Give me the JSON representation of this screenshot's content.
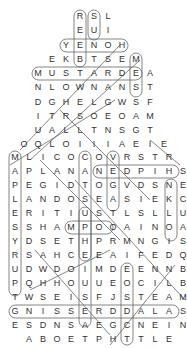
{
  "puzzle": {
    "type": "word-search",
    "shape": "house",
    "rows": [
      {
        "y": 17,
        "x0": 80,
        "letters": "RSL"
      },
      {
        "y": 31,
        "x0": 80,
        "letters": "EUI"
      },
      {
        "y": 46,
        "x0": 66,
        "letters": "YENOH"
      },
      {
        "y": 60,
        "x0": 52,
        "letters": "EKBTSEM"
      },
      {
        "y": 74,
        "x0": 38,
        "letters": "MUSTARDEA"
      },
      {
        "y": 88,
        "x0": 38,
        "letters": "NLOWNANST"
      },
      {
        "y": 103,
        "x0": 38,
        "letters": "DGHELGWSF"
      },
      {
        "y": 117,
        "x0": 38,
        "letters": "ITRSOEOAM"
      },
      {
        "y": 131,
        "x0": 38,
        "letters": "UALLTNSGT"
      },
      {
        "y": 145,
        "x0": 24,
        "letters": "OQLOIIIAEIE"
      },
      {
        "y": 158,
        "x0": 15,
        "letters": "MLICOCOVRSTR"
      },
      {
        "y": 172,
        "x0": 15,
        "letters": "APLANANEDPIHS"
      },
      {
        "y": 186,
        "x0": 15,
        "letters": "PEGIDTOGVDSNE"
      },
      {
        "y": 200,
        "x0": 15,
        "letters": "LANDOSEASIEKC"
      },
      {
        "y": 214,
        "x0": 15,
        "letters": "ERITIUSTLSLLU"
      },
      {
        "y": 228,
        "x0": 15,
        "letters": "SSHAMPOOAINOA"
      },
      {
        "y": 242,
        "x0": 15,
        "letters": "YDSETHPRMNGIS"
      },
      {
        "y": 256,
        "x0": 15,
        "letters": "RSAHCEEAIFEDQ"
      },
      {
        "y": 270,
        "x0": 15,
        "letters": "UDWDOIMDEENNB"
      },
      {
        "y": 284,
        "x0": 15,
        "letters": "PQHHOUUEOCILB"
      },
      {
        "y": 298,
        "x0": 15,
        "letters": "TWSEISFJSTEAM"
      },
      {
        "y": 312,
        "x0": 15,
        "letters": "GNISSERDDALAS"
      },
      {
        "y": 326,
        "x0": 15,
        "letters": "ESDNSAEGCNEIN"
      },
      {
        "y": 340,
        "x0": 29,
        "letters": "ABOETPHTTLE"
      }
    ],
    "col_spacing": 14,
    "found_words_visible": [
      "HONEY",
      "MUSTARD",
      "SHAMPOO",
      "SALAD DRESSING",
      "SHIP",
      "MILK"
    ],
    "colors": {
      "text": "#333333",
      "outline": "#555555",
      "background": "#ffffff"
    }
  }
}
